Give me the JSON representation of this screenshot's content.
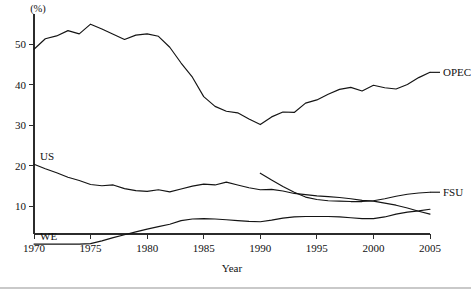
{
  "chart_data": {
    "type": "line",
    "title": "",
    "xlabel": "Year",
    "ylabel": "(%)",
    "unit_label": "(%)",
    "grid": false,
    "legend_position": "right-inline",
    "xlim": [
      1970,
      2005
    ],
    "ylim": [
      0,
      57
    ],
    "x_ticks": [
      1970,
      1975,
      1980,
      1985,
      1990,
      1995,
      2000,
      2005
    ],
    "x_tick_labels": [
      "1970",
      "1975",
      "1980",
      "1985",
      "1990",
      "1995",
      "2000",
      "2005"
    ],
    "y_ticks": [
      10,
      20,
      30,
      40,
      50
    ],
    "y_tick_labels": [
      "10",
      "20",
      "30",
      "40",
      "50"
    ],
    "series": [
      {
        "name": "OPEC",
        "label": "OPEC",
        "label_position": "right",
        "x": [
          1970,
          1971,
          1972,
          1973,
          1974,
          1975,
          1976,
          1977,
          1978,
          1979,
          1980,
          1981,
          1982,
          1983,
          1984,
          1985,
          1986,
          1987,
          1988,
          1989,
          1990,
          1991,
          1992,
          1993,
          1994,
          1995,
          1996,
          1997,
          1998,
          1999,
          2000,
          2001,
          2002,
          2003,
          2004,
          2005
        ],
        "values": [
          48.7,
          51.3,
          52.0,
          53.3,
          52.5,
          54.9,
          53.7,
          52.4,
          51.1,
          52.2,
          52.5,
          51.9,
          49.2,
          45.3,
          41.8,
          37.0,
          34.6,
          33.4,
          33.0,
          31.5,
          30.1,
          32.0,
          33.2,
          33.1,
          35.4,
          36.2,
          37.6,
          38.8,
          39.3,
          38.4,
          39.8,
          39.2,
          38.9,
          40.0,
          41.7,
          43.0
        ]
      },
      {
        "name": "US",
        "label": "US",
        "label_position": "left-inner",
        "x": [
          1970,
          1971,
          1972,
          1973,
          1974,
          1975,
          1976,
          1977,
          1978,
          1979,
          1980,
          1981,
          1982,
          1983,
          1984,
          1985,
          1986,
          1987,
          1988,
          1989,
          1990,
          1991,
          1992,
          1993,
          1994,
          1995,
          1996,
          1997,
          1998,
          1999,
          2000,
          2001,
          2002,
          2003,
          2004,
          2005
        ],
        "values": [
          20.3,
          19.2,
          18.2,
          17.1,
          16.3,
          15.3,
          15.0,
          15.2,
          14.3,
          13.8,
          13.6,
          14.0,
          13.5,
          14.2,
          14.9,
          15.4,
          15.2,
          15.9,
          15.2,
          14.5,
          14.0,
          14.1,
          13.7,
          13.1,
          12.8,
          12.5,
          12.3,
          12.1,
          11.8,
          11.4,
          11.2,
          10.7,
          10.2,
          9.5,
          8.7,
          8.0
        ]
      },
      {
        "name": "WE",
        "label": "WE",
        "label_position": "left-inner",
        "x": [
          1970,
          1971,
          1972,
          1973,
          1974,
          1975,
          1976,
          1977,
          1978,
          1979,
          1980,
          1981,
          1982,
          1983,
          1984,
          1985,
          1986,
          1987,
          1988,
          1989,
          1990,
          1991,
          1992,
          1993,
          1994,
          1995,
          1996,
          1997,
          1998,
          1999,
          2000,
          2001,
          2002,
          2003,
          2004,
          2005
        ],
        "values": [
          0.6,
          0.6,
          0.6,
          0.6,
          0.6,
          0.7,
          1.4,
          2.2,
          2.9,
          3.6,
          4.3,
          4.9,
          5.5,
          6.4,
          6.8,
          6.9,
          6.8,
          6.6,
          6.4,
          6.2,
          6.1,
          6.5,
          7.0,
          7.3,
          7.4,
          7.4,
          7.4,
          7.3,
          7.1,
          6.9,
          6.9,
          7.3,
          8.0,
          8.5,
          8.8,
          9.2
        ]
      },
      {
        "name": "FSU",
        "label": "FSU",
        "label_position": "right",
        "x": [
          1990,
          1991,
          1992,
          1993,
          1994,
          1995,
          1996,
          1997,
          1998,
          1999,
          2000,
          2001,
          2002,
          2003,
          2004,
          2005
        ],
        "values": [
          18.1,
          16.4,
          14.8,
          13.4,
          12.2,
          11.6,
          11.3,
          11.2,
          11.1,
          11.1,
          11.3,
          11.8,
          12.4,
          12.9,
          13.2,
          13.4
        ]
      }
    ],
    "colors": {
      "line": "#141414",
      "axis": "#2b2b2b",
      "background": "#ffffff",
      "footer_rule": "#c9c9c9"
    }
  }
}
